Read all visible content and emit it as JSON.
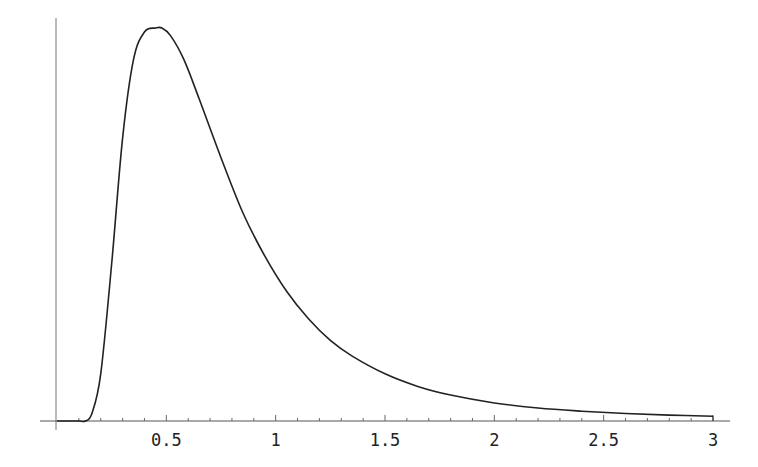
{
  "chart_data": {
    "type": "line",
    "title": "",
    "xlabel": "",
    "ylabel": "",
    "xlim": [
      0,
      3
    ],
    "ylim": [
      0,
      1.05
    ],
    "grid": false,
    "legend": null,
    "x_ticks": [
      "0.5",
      "1",
      "1.5",
      "2",
      "2.5",
      "3"
    ],
    "x_tick_values": [
      0.5,
      1,
      1.5,
      2,
      2.5,
      3
    ],
    "y_ticks": [],
    "series": [
      {
        "name": "density",
        "x": [
          0.0,
          0.1,
          0.13,
          0.16,
          0.2,
          0.25,
          0.3,
          0.35,
          0.4,
          0.45,
          0.48,
          0.52,
          0.58,
          0.65,
          0.75,
          0.85,
          0.95,
          1.05,
          1.15,
          1.25,
          1.35,
          1.5,
          1.65,
          1.8,
          2.0,
          2.2,
          2.4,
          2.6,
          2.8,
          3.0
        ],
        "y": [
          0.0,
          0.0,
          0.0,
          0.02,
          0.12,
          0.4,
          0.72,
          0.92,
          0.99,
          1.0,
          1.0,
          0.98,
          0.92,
          0.82,
          0.67,
          0.53,
          0.42,
          0.33,
          0.26,
          0.205,
          0.165,
          0.12,
          0.088,
          0.066,
          0.046,
          0.033,
          0.025,
          0.019,
          0.015,
          0.012
        ]
      }
    ]
  }
}
